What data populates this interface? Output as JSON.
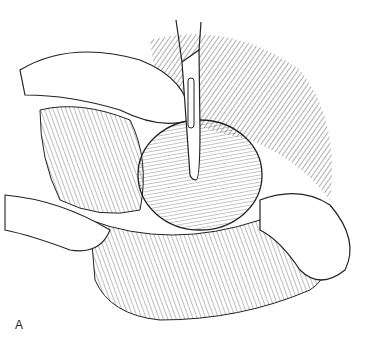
{
  "figure": {
    "panel_label": "A"
  }
}
